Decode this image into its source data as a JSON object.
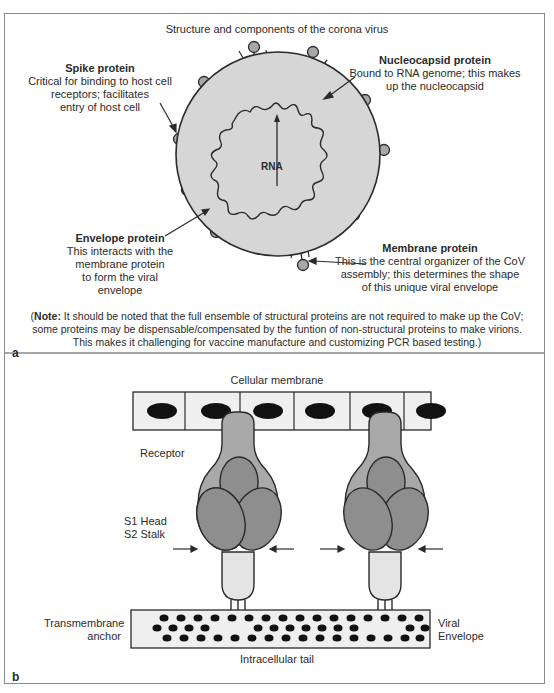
{
  "panel_a": {
    "title": "Structure and components of the corona virus",
    "rna_label": "RNA",
    "spike": {
      "heading": "Spike protein",
      "lines": [
        "Critical for binding to host cell",
        "receptors; facilitates",
        "entry of host cell"
      ]
    },
    "nucleocapsid": {
      "heading": "Nucleocapsid protein",
      "lines": [
        "Bound to RNA genome; this makes",
        "up the nucleocapsid"
      ]
    },
    "envelope": {
      "heading": "Envelope protein",
      "lines": [
        "This interacts with the",
        "membrane protein",
        "to form the viral",
        "envelope"
      ]
    },
    "membrane": {
      "heading": "Membrane protein",
      "lines": [
        "This is the central organizer of the CoV",
        "assembly; this determines the shape",
        "of this unique viral envelope"
      ]
    },
    "note": {
      "prefix": "Note:",
      "line1": " It should be noted that the full ensemble of structural proteins are not required to make up the CoV;",
      "line2": "some proteins may be dispensable/compensated by the funtion of non-structural proteins to make virions.",
      "line3": "This makes it challenging for vaccine manufacture and customizing PCR based testing.)",
      "open_paren": "("
    },
    "letter": "a"
  },
  "panel_b": {
    "cellular_membrane": "Cellular membrane",
    "receptor": "Receptor",
    "s1_head": "S1 Head",
    "s2_stalk": "S2 Stalk",
    "transmembrane_1": "Transmembrane",
    "transmembrane_2": "anchor",
    "viral_1": "Viral",
    "viral_2": "Envelope",
    "intracellular_tail": "Intracellular tail",
    "letter": "b"
  },
  "colors": {
    "virus_fill": "#d6d6d6",
    "spike_head": "#a8a8a8",
    "receptor_fill": "#a9a9a9",
    "s1_fill": "#8e8e8e",
    "stalk_fill": "#e4e4e4",
    "cell_fill": "#efefef",
    "outline": "#2a2a2a"
  }
}
